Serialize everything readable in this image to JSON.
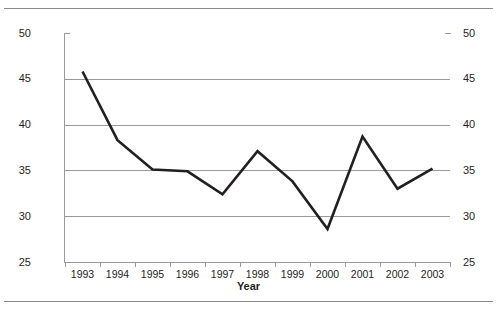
{
  "chart_data": {
    "type": "line",
    "title": "",
    "xlabel": "Year",
    "ylabel": "Payout Rate (Percent)",
    "ylim": [
      25,
      50
    ],
    "ytick_values": [
      25,
      30,
      35,
      40,
      45,
      50
    ],
    "ytick_labels_left": [
      "25",
      "30",
      "35",
      "40",
      "45",
      "50"
    ],
    "ytick_labels_right": [
      "25",
      "30",
      "35",
      "40",
      "45",
      "50"
    ],
    "grid": "horizontal",
    "gridline_values": [
      30,
      35,
      40,
      45
    ],
    "legend": "none",
    "categories": [
      "1993",
      "1994",
      "1995",
      "1996",
      "1997",
      "1998",
      "1999",
      "2000",
      "2001",
      "2002",
      "2003"
    ],
    "x": [
      1993,
      1994,
      1995,
      1996,
      1997,
      1998,
      1999,
      2000,
      2001,
      2002,
      2003
    ],
    "values": [
      45.8,
      38.3,
      35.1,
      34.9,
      32.4,
      37.1,
      33.8,
      28.6,
      38.7,
      33.0,
      35.2
    ],
    "series": [
      {
        "name": "Payout Rate",
        "values": [
          45.8,
          38.3,
          35.1,
          34.9,
          32.4,
          37.1,
          33.8,
          28.6,
          38.7,
          33.0,
          35.2
        ],
        "color": "#231f20",
        "line_width": 2.6,
        "markers": "none"
      }
    ]
  },
  "colors": {
    "line": "#231f20",
    "gridline": "#9a9a9a",
    "axis": "#9a9a9a",
    "rule": "#8a8a8a",
    "text": "#231f20",
    "background": "#ffffff"
  }
}
